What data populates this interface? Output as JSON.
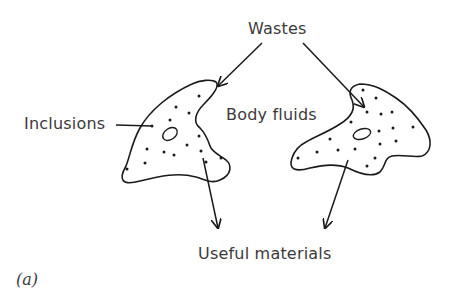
{
  "figure": {
    "panel_label": "(a)",
    "labels": {
      "wastes": "Wastes",
      "inclusions": "Inclusions",
      "body_fluids": "Body fluids",
      "useful_materials": "Useful materials"
    },
    "cells": [
      {
        "name": "left-cell",
        "contains": [
          "inclusions",
          "vacuole"
        ]
      },
      {
        "name": "right-cell",
        "contains": [
          "inclusions",
          "vacuole"
        ]
      }
    ],
    "arrows": [
      {
        "from": "Wastes",
        "to": "left-cell"
      },
      {
        "from": "Wastes",
        "to": "right-cell"
      },
      {
        "from": "left-cell",
        "to": "Useful materials"
      },
      {
        "from": "right-cell",
        "to": "Useful materials"
      }
    ],
    "colors": {
      "ink": "#1a1a1a",
      "text": "#3a3a3a",
      "background": "#ffffff"
    }
  }
}
